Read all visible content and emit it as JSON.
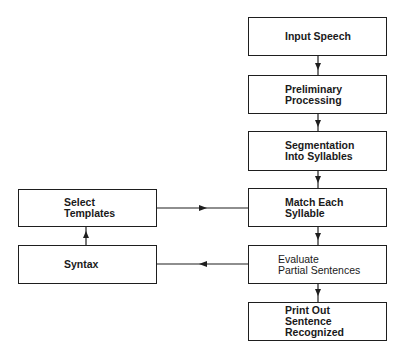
{
  "diagram": {
    "type": "flowchart",
    "main_flow": [
      {
        "id": "input",
        "lines": [
          "Input Speech"
        ]
      },
      {
        "id": "preliminary",
        "lines": [
          "Preliminary",
          "Processing"
        ]
      },
      {
        "id": "segmentation",
        "lines": [
          "Segmentation",
          "Into Syllables"
        ]
      },
      {
        "id": "match",
        "lines": [
          "Match Each",
          "Syllable"
        ]
      },
      {
        "id": "evaluate",
        "lines": [
          "Evaluate",
          "Partial Sentences"
        ]
      },
      {
        "id": "print",
        "lines": [
          "Print Out",
          "Sentence",
          "Recognized"
        ]
      }
    ],
    "side_flow": [
      {
        "id": "select",
        "lines": [
          "Select",
          "Templates"
        ]
      },
      {
        "id": "syntax",
        "lines": [
          "Syntax"
        ]
      }
    ],
    "edges": [
      [
        "input",
        "preliminary"
      ],
      [
        "preliminary",
        "segmentation"
      ],
      [
        "segmentation",
        "match"
      ],
      [
        "match",
        "evaluate"
      ],
      [
        "evaluate",
        "print"
      ],
      [
        "evaluate",
        "syntax"
      ],
      [
        "syntax",
        "select"
      ],
      [
        "select",
        "match"
      ]
    ]
  }
}
